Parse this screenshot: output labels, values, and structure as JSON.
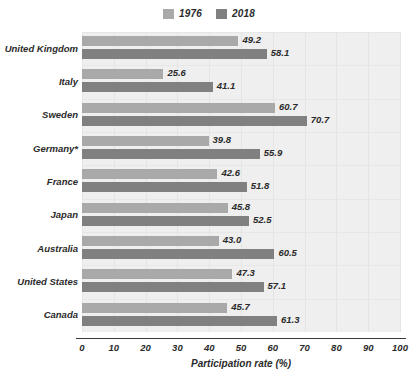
{
  "chart_data": {
    "type": "bar",
    "orientation": "horizontal",
    "title": "",
    "xlabel": "Participation rate (%)",
    "ylabel": "",
    "xlim": [
      0,
      100
    ],
    "xticks": [
      "0",
      "10",
      "20",
      "30",
      "40",
      "50",
      "60",
      "70",
      "80",
      "90",
      "100"
    ],
    "grid": true,
    "legend_position": "top-center",
    "categories": [
      "United Kingdom",
      "Italy",
      "Sweden",
      "Germany*",
      "France",
      "Japan",
      "Australia",
      "United States",
      "Canada"
    ],
    "series": [
      {
        "name": "1976",
        "color": "#a9a9a9",
        "values": [
          49.2,
          25.6,
          60.7,
          39.8,
          42.6,
          45.8,
          43.0,
          47.3,
          45.7
        ],
        "labels": [
          "49.2",
          "25.6",
          "60.7",
          "39.8",
          "42.6",
          "45.8",
          "43.0",
          "47.3",
          "45.7"
        ]
      },
      {
        "name": "2018",
        "color": "#808080",
        "values": [
          58.1,
          41.1,
          70.7,
          55.9,
          51.8,
          52.5,
          60.5,
          57.1,
          61.3
        ],
        "labels": [
          "58.1",
          "41.1",
          "70.7",
          "55.9",
          "51.8",
          "52.5",
          "60.5",
          "57.1",
          "61.3"
        ]
      }
    ]
  },
  "legend": {
    "items": [
      {
        "label": "1976",
        "color": "#a9a9a9"
      },
      {
        "label": "2018",
        "color": "#808080"
      }
    ]
  },
  "colors": {
    "series_1976": "#a9a9a9",
    "series_2018": "#808080",
    "plot_background": "#efefef",
    "axis": "#3a3a3a",
    "text": "#2b2b2b"
  }
}
